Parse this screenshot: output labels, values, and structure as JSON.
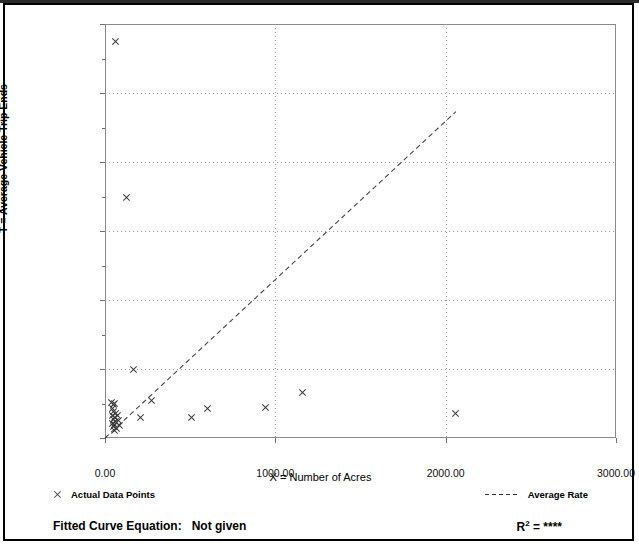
{
  "chart_data": {
    "type": "scatter",
    "title": "",
    "xlabel": "X = Number of Acres",
    "ylabel": "T = Average Vehicle Trip Ends",
    "xlim": [
      0,
      3000
    ],
    "ylim": [
      0,
      6000
    ],
    "x_ticks": [
      "0.00",
      "1000.00",
      "2000.00",
      "3000.00"
    ],
    "x_tick_values": [
      0,
      1000,
      2000,
      3000
    ],
    "y_ticks": [
      "0",
      "1,000",
      "2,000",
      "3,000",
      "4,000",
      "5,000",
      "6,000"
    ],
    "y_tick_values": [
      0,
      1000,
      2000,
      3000,
      4000,
      5000,
      6000
    ],
    "y_minor_values": [
      500,
      1500,
      2500,
      3500,
      4500,
      5500
    ],
    "grid": true,
    "legend_position": "below-axes",
    "series": [
      {
        "name": "Actual Data Points",
        "marker": "x",
        "points": [
          [
            60,
            5750
          ],
          [
            125,
            3480
          ],
          [
            170,
            990
          ],
          [
            275,
            545
          ],
          [
            210,
            295
          ],
          [
            510,
            300
          ],
          [
            600,
            425
          ],
          [
            940,
            440
          ],
          [
            1160,
            660
          ],
          [
            2060,
            355
          ],
          [
            40,
            520
          ],
          [
            48,
            480
          ],
          [
            55,
            500
          ],
          [
            42,
            430
          ],
          [
            52,
            390
          ],
          [
            60,
            360
          ],
          [
            45,
            330
          ],
          [
            58,
            300
          ],
          [
            50,
            265
          ],
          [
            62,
            240
          ],
          [
            44,
            215
          ],
          [
            55,
            190
          ],
          [
            48,
            160
          ],
          [
            66,
            140
          ],
          [
            58,
            105
          ],
          [
            72,
            330
          ],
          [
            78,
            250
          ],
          [
            85,
            185
          ]
        ]
      }
    ],
    "trendline": {
      "name": "Average Rate",
      "style": "dashed",
      "x_start": 0,
      "y_start": 0,
      "x_end": 2060,
      "y_end": 4730
    }
  },
  "legend": {
    "data_points_label": "Actual Data Points",
    "average_rate_label": "Average Rate",
    "data_points_icon": "x-marker-icon",
    "average_rate_icon": "dashed-line-icon"
  },
  "footer": {
    "equation_label": "Fitted Curve Equation:",
    "equation_value": "Not given",
    "r_squared_prefix": "R",
    "r_squared_exponent": "2",
    "r_squared_equals": " = ",
    "r_squared_value": "****"
  },
  "colors": {
    "marker": "#3a3a3a",
    "axis": "#8a8a8a",
    "grid": "#9a9a9a",
    "border": "#000000",
    "text": "#000000"
  }
}
